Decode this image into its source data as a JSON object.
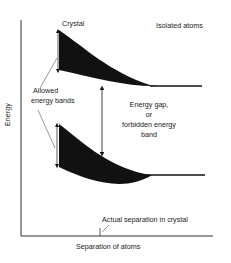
{
  "diagram": {
    "labels": {
      "crystal": "Crystal",
      "isolated_atoms": "Isolated atoms",
      "allowed_bands_line1": "Allowed",
      "allowed_bands_line2": "energy bands",
      "gap_line1": "Energy gap,",
      "gap_line2": "or",
      "gap_line3": "forbidden energy",
      "gap_line4": "band",
      "y_axis": "Energy",
      "x_axis": "Separation of atoms",
      "actual_separation": "Actual separation in crystal"
    },
    "colors": {
      "ink": "#111111",
      "axis": "#333333",
      "background": "#ffffff"
    },
    "bands": [
      {
        "name": "upper-allowed-band",
        "left_top_y": 30,
        "left_bottom_y": 72,
        "merge_x": 157,
        "merge_y": 86,
        "isolated_line_end_x": 202
      },
      {
        "name": "lower-allowed-band",
        "left_top_y": 124,
        "left_bottom_y": 167,
        "merge_x": 152,
        "merge_y": 175,
        "isolated_line_end_x": 205
      }
    ]
  }
}
